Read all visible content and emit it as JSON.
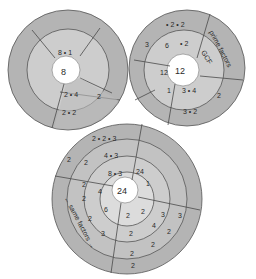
{
  "diagram": {
    "colors": {
      "outer_ring": "#b4b4b4",
      "middle_ring": "#cdcdcd",
      "inner_ring": "#dcdcdc",
      "center": "#ffffff",
      "shadow_ring": "#a8a8a8",
      "text": "#2a2a2a"
    },
    "wheel_8": {
      "center": "8",
      "ring1_top": "8 • 1",
      "ring1_bottom": "2 • 4",
      "ring1_right": "2",
      "ring2_bottom": "2 • 2"
    },
    "wheel_12": {
      "center": "12",
      "label_gcf": "GCF",
      "label_prime": "prime factors",
      "ring1_top": "• 2",
      "ring1_left": "6",
      "ring1_left2": "12",
      "ring1_left3": "1",
      "ring1_bottom": "3 • 4",
      "ring2_top": "• 2 • 2",
      "ring2_left": "3",
      "ring2_right": "2",
      "ring2_bottom": "3 • 2"
    },
    "wheel_24": {
      "center": "24",
      "label_same": "← same factors →",
      "ring1_top": "8 • 3",
      "ring1_right": "24",
      "ring1_right2": "1",
      "ring1_left": "4",
      "ring1_bottomleft": "6",
      "ring1_bottom": "2",
      "ring1_bottomright": "2",
      "ring2_top": "4 • 3",
      "ring2_left": "2",
      "ring2_left2": "2",
      "ring2_left3": "2",
      "ring2_left4": "2",
      "ring2_left5": "3",
      "ring2_right": "3",
      "ring2_bottom": "2",
      "ring2_bottomright": "4",
      "ring3_top": "2 • 2 • 3",
      "ring3_left": "2",
      "ring3_right": "3",
      "ring3_bottomright": "2",
      "ring3_bottom": "2",
      "ring4_bottom": "2",
      "ring4_bottomright": "2"
    }
  }
}
